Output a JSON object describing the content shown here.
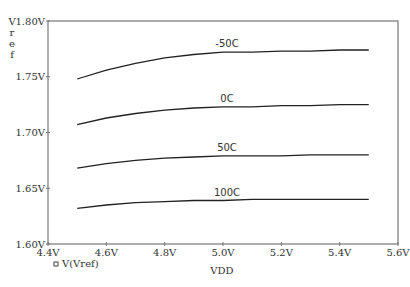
{
  "chart_data": {
    "type": "line",
    "title": "",
    "xlabel": "VDD",
    "ylabel": "Vref",
    "xlim": [
      4.4,
      5.6
    ],
    "ylim": [
      1.6,
      1.8
    ],
    "x_ticks": [
      "4.4V",
      "4.6V",
      "4.8V",
      "5.0V",
      "5.2V",
      "5.4V",
      "5.6V"
    ],
    "y_ticks": [
      "1.60V",
      "1.65V",
      "1.70V",
      "1.75V",
      "1.80V"
    ],
    "grid": false,
    "legend": {
      "position": "bottom-left",
      "entries": [
        "V(Vref)"
      ]
    },
    "x": [
      4.5,
      4.6,
      4.7,
      4.8,
      4.9,
      5.0,
      5.1,
      5.2,
      5.3,
      5.4,
      5.5
    ],
    "series": [
      {
        "name": "-50C",
        "values": [
          1.748,
          1.756,
          1.762,
          1.767,
          1.77,
          1.772,
          1.772,
          1.773,
          1.773,
          1.774,
          1.774
        ]
      },
      {
        "name": "0C",
        "values": [
          1.707,
          1.713,
          1.717,
          1.72,
          1.722,
          1.723,
          1.723,
          1.724,
          1.724,
          1.725,
          1.725
        ]
      },
      {
        "name": "50C",
        "values": [
          1.668,
          1.672,
          1.675,
          1.677,
          1.678,
          1.679,
          1.679,
          1.679,
          1.68,
          1.68,
          1.68
        ]
      },
      {
        "name": "100C",
        "values": [
          1.632,
          1.635,
          1.637,
          1.638,
          1.639,
          1.639,
          1.64,
          1.64,
          1.64,
          1.64,
          1.64
        ]
      }
    ],
    "annotations": [
      {
        "text": "-50C",
        "x": 5.0
      },
      {
        "text": "0C",
        "x": 5.0
      },
      {
        "text": "50C",
        "x": 5.0
      },
      {
        "text": "100C",
        "x": 5.0
      }
    ]
  },
  "colors": {
    "axis": "#666666",
    "curve": "#222222",
    "text": "#333333"
  }
}
